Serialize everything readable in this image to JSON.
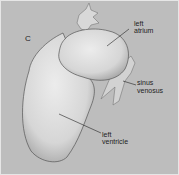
{
  "figure": {
    "panel_letter": "C",
    "labels": {
      "left_atrium_1": "left",
      "left_atrium_2": "atrium",
      "sinus_venosus_1": "sinus",
      "sinus_venosus_2": "venosus",
      "left_ventricle_1": "left",
      "left_ventricle_2": "ventricle"
    },
    "colors": {
      "background": "#bdbdbd",
      "organ": "#dcdcdc",
      "outline": "#555555"
    }
  }
}
